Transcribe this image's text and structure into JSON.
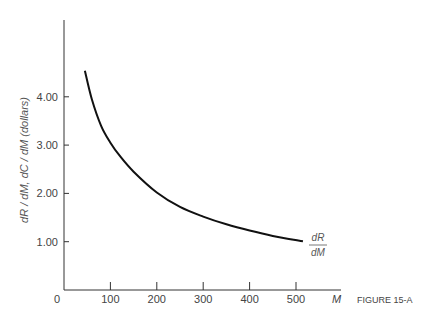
{
  "figure": {
    "caption": "FIGURE 15-A"
  },
  "chart_data": {
    "type": "line",
    "title": "",
    "xlabel": "M",
    "ylabel": "dR / dM, dC / dM (dollars)",
    "x_ticks": [
      "0",
      "100",
      "200",
      "300",
      "400",
      "500"
    ],
    "y_ticks": [
      "1.00",
      "2.00",
      "3.00",
      "4.00"
    ],
    "xlim": [
      0,
      590
    ],
    "ylim": [
      0,
      5.8
    ],
    "grid": false,
    "series": [
      {
        "name": "dR/dM",
        "label_num": "dR",
        "label_den": "dM",
        "x": [
          45,
          60,
          80,
          100,
          120,
          150,
          200,
          250,
          300,
          350,
          400,
          450,
          515
        ],
        "values": [
          4.54,
          3.95,
          3.4,
          3.05,
          2.78,
          2.45,
          2.02,
          1.72,
          1.52,
          1.36,
          1.23,
          1.12,
          1.01
        ]
      }
    ]
  }
}
